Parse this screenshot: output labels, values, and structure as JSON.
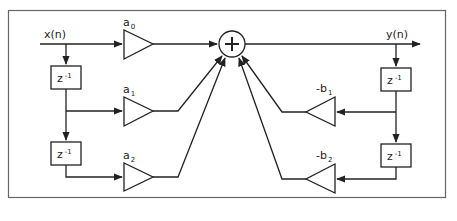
{
  "diagram": {
    "frame_color": "#555555",
    "line_color": "#222222",
    "input": {
      "label_main": "x(n)"
    },
    "output": {
      "label_main": "y(n)"
    },
    "summer": {
      "symbol": "+"
    },
    "delay_label": {
      "base": "z",
      "exp": "-1"
    },
    "feedforward": [
      {
        "base": "a",
        "sub": "0"
      },
      {
        "base": "a",
        "sub": "1"
      },
      {
        "base": "a",
        "sub": "2"
      }
    ],
    "feedback": [
      {
        "base": "-b",
        "sub": "1"
      },
      {
        "base": "-b",
        "sub": "2"
      }
    ],
    "nodes": [
      "x(n)",
      "z^-1 (input, 1)",
      "z^-1 (input, 2)",
      "a0",
      "a1",
      "a2",
      "sum",
      "y(n)",
      "z^-1 (output, 1)",
      "z^-1 (output, 2)",
      "-b1",
      "-b2"
    ],
    "edges": [
      [
        "x(n)",
        "a0"
      ],
      [
        "x(n)",
        "z^-1 (input, 1)"
      ],
      [
        "z^-1 (input, 1)",
        "a1"
      ],
      [
        "z^-1 (input, 1)",
        "z^-1 (input, 2)"
      ],
      [
        "z^-1 (input, 2)",
        "a2"
      ],
      [
        "a0",
        "sum"
      ],
      [
        "a1",
        "sum"
      ],
      [
        "a2",
        "sum"
      ],
      [
        "sum",
        "y(n)"
      ],
      [
        "y(n)",
        "z^-1 (output, 1)"
      ],
      [
        "z^-1 (output, 1)",
        "-b1"
      ],
      [
        "z^-1 (output, 1)",
        "z^-1 (output, 2)"
      ],
      [
        "z^-1 (output, 2)",
        "-b2"
      ],
      [
        "-b1",
        "sum"
      ],
      [
        "-b2",
        "sum"
      ]
    ]
  }
}
